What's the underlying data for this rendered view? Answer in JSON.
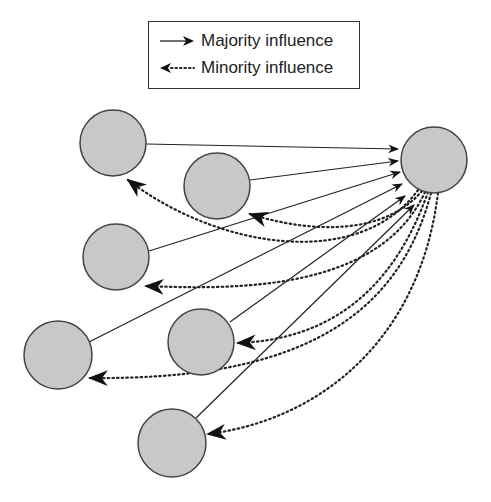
{
  "legend": {
    "majority_label": "Majority influence",
    "minority_label": "Minority influence"
  },
  "colors": {
    "node_fill": "#c8c8c8",
    "node_stroke": "#444444",
    "line": "#222222"
  },
  "nodes": {
    "target": {
      "cx": 434,
      "cy": 160,
      "r": 33
    },
    "members": [
      {
        "id": "member-1",
        "cx": 113,
        "cy": 143,
        "r": 33
      },
      {
        "id": "member-2",
        "cx": 217,
        "cy": 186,
        "r": 33
      },
      {
        "id": "member-3",
        "cx": 116,
        "cy": 257,
        "r": 33
      },
      {
        "id": "member-4",
        "cx": 58,
        "cy": 355,
        "r": 34
      },
      {
        "id": "member-5",
        "cx": 201,
        "cy": 342,
        "r": 33
      },
      {
        "id": "member-6",
        "cx": 172,
        "cy": 443,
        "r": 34
      }
    ]
  }
}
